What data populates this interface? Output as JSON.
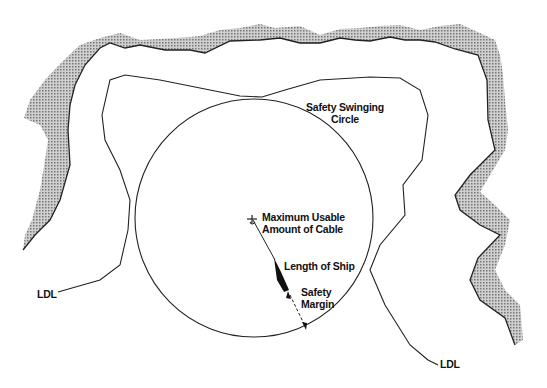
{
  "diagram": {
    "labels": {
      "swing_circle_1": "Safety Swinging",
      "swing_circle_2": "Circle",
      "cable_1": "Maximum Usable",
      "cable_2": "Amount of Cable",
      "ship": "Length of Ship",
      "margin_1": "Safety",
      "margin_2": "Margin",
      "ldl_left": "LDL",
      "ldl_right": "LDL"
    },
    "colors": {
      "line": "#222222",
      "shore_fill": "#a8a8a8",
      "background": "#ffffff"
    }
  }
}
